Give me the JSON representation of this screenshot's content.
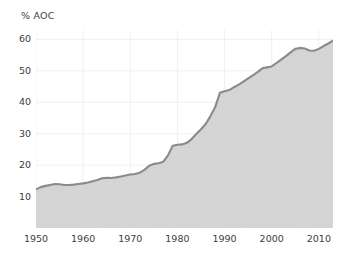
{
  "chart_data": {
    "type": "area",
    "title": "",
    "subtitle": "",
    "xlabel": "",
    "ylabel": "% AOC",
    "ylabel_position": "top-left",
    "xlim": [
      1950,
      2013
    ],
    "ylim": [
      0,
      63
    ],
    "grid": true,
    "grid_color": "#f0f0f0",
    "legend": "none",
    "area_fill_color": "#d6d6d6",
    "line_color": "#8a8a8a",
    "line_width": 2.1,
    "axis_text_color": "#3d3d3d",
    "background_color": "#ffffff",
    "yticks": [
      10,
      20,
      30,
      40,
      50,
      60
    ],
    "ytick_labels": [
      "10",
      "20",
      "30",
      "40",
      "50",
      "60"
    ],
    "xticks": [
      1950,
      1960,
      1970,
      1980,
      1990,
      2000,
      2010
    ],
    "xtick_labels": [
      "1950",
      "1960",
      "1970",
      "1980",
      "1990",
      "2000",
      "2010"
    ],
    "series": [
      {
        "name": "% AOC",
        "x": [
          1950,
          1951,
          1952,
          1953,
          1954,
          1955,
          1956,
          1957,
          1958,
          1959,
          1960,
          1961,
          1962,
          1963,
          1964,
          1965,
          1966,
          1967,
          1968,
          1969,
          1970,
          1971,
          1972,
          1973,
          1974,
          1975,
          1976,
          1977,
          1978,
          1979,
          1980,
          1981,
          1982,
          1983,
          1984,
          1985,
          1986,
          1987,
          1988,
          1989,
          1990,
          1991,
          1992,
          1993,
          1994,
          1995,
          1996,
          1997,
          1998,
          1999,
          2000,
          2001,
          2002,
          2003,
          2004,
          2005,
          2006,
          2007,
          2008,
          2009,
          2010,
          2011,
          2012,
          2013
        ],
        "values": [
          12.3,
          13.0,
          13.4,
          13.7,
          14.0,
          13.9,
          13.7,
          13.7,
          13.8,
          14.0,
          14.2,
          14.5,
          14.9,
          15.3,
          15.8,
          16.0,
          15.9,
          16.1,
          16.4,
          16.7,
          17.0,
          17.2,
          17.6,
          18.5,
          19.8,
          20.4,
          20.6,
          21.1,
          23.1,
          26.2,
          26.5,
          26.6,
          27.1,
          28.3,
          29.9,
          31.4,
          33.1,
          35.6,
          38.4,
          43.0,
          43.5,
          43.9,
          44.8,
          45.6,
          46.6,
          47.6,
          48.6,
          49.6,
          50.8,
          51.1,
          51.4,
          52.5,
          53.6,
          54.7,
          55.9,
          57.0,
          57.3,
          57.1,
          56.5,
          56.4,
          57.0,
          57.9,
          58.7,
          59.6
        ]
      }
    ]
  }
}
